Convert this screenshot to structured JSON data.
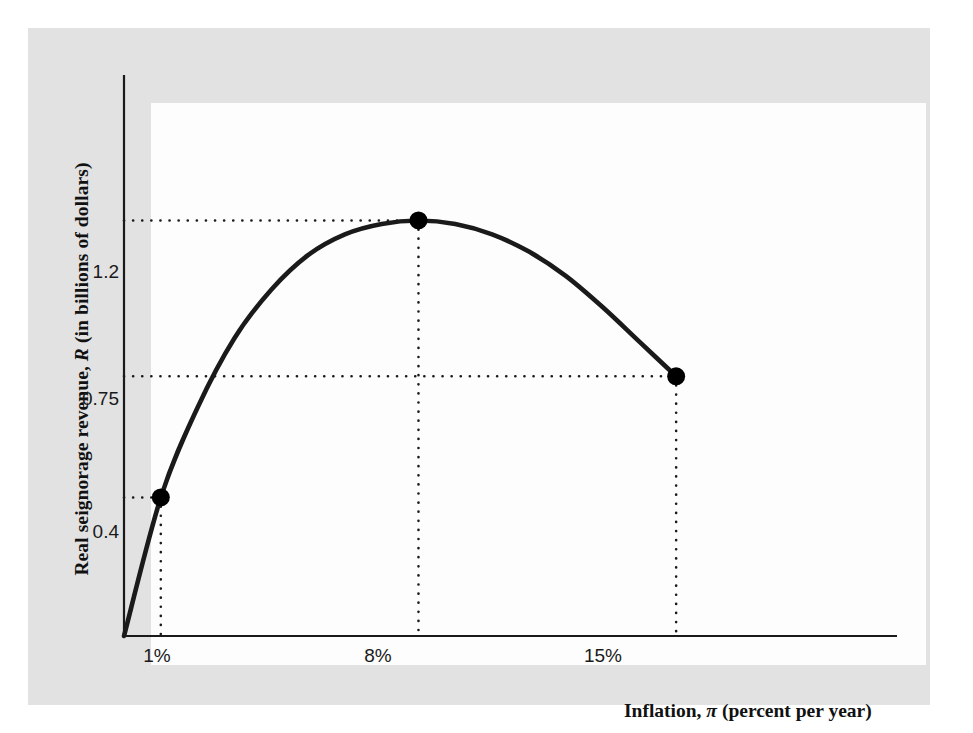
{
  "figure": {
    "background_color": "#e2e2e2",
    "plot_background_color": "#fdfdfd",
    "page_background_color": "#ffffff",
    "curve_color": "#1a1a1a",
    "axis_color": "#1a1a1a",
    "marker_color": "#000000",
    "guide_color": "#1a1a1a"
  },
  "chart_data": {
    "type": "line",
    "title": "",
    "subtitle": "",
    "xlabel_plain": "Inflation, π (percent per year)",
    "xlabel_prefix": "Inflation, ",
    "xlabel_symbol": "π",
    "xlabel_suffix": " (percent per year)",
    "ylabel_plain": "Real seignorage revenue, R (in billions of dollars)",
    "ylabel_prefix": "Real seignorage revenue, ",
    "ylabel_symbol": "R",
    "ylabel_suffix": " (in billions of dollars)",
    "xlim": [
      0,
      21
    ],
    "ylim": [
      0,
      1.62
    ],
    "grid": false,
    "legend": null,
    "x_tick_labels": [
      "1%",
      "8%",
      "15%"
    ],
    "x_tick_values": [
      1,
      8,
      15
    ],
    "y_tick_labels": [
      "0.4",
      "0.75",
      "1.2"
    ],
    "y_tick_values": [
      0.4,
      0.75,
      1.2
    ],
    "series": [
      {
        "name": "Seignorage revenue curve",
        "x": [
          0,
          1,
          2,
          3,
          4,
          5,
          6,
          7,
          8,
          9,
          10,
          11,
          12,
          13,
          14,
          15
        ],
        "y": [
          0.0,
          0.4,
          0.66,
          0.86,
          1.0,
          1.1,
          1.16,
          1.19,
          1.2,
          1.19,
          1.16,
          1.11,
          1.04,
          0.95,
          0.85,
          0.75
        ]
      }
    ],
    "markers": [
      {
        "label": "low-inflation-point",
        "x": 1,
        "y": 0.4,
        "x_label": "1%",
        "y_label": "0.4"
      },
      {
        "label": "revenue-maximizing-point",
        "x": 8,
        "y": 1.2,
        "x_label": "8%",
        "y_label": "1.2"
      },
      {
        "label": "high-inflation-point",
        "x": 15,
        "y": 0.75,
        "x_label": "15%",
        "y_label": "0.75"
      }
    ],
    "guide_lines": [
      {
        "from_axis": "y",
        "value": 0.4,
        "to_x": 1
      },
      {
        "from_axis": "y",
        "value": 0.75,
        "to_x": 15
      },
      {
        "from_axis": "y",
        "value": 1.2,
        "to_x": 8
      },
      {
        "from_axis": "x",
        "value": 1,
        "to_y": 0.4
      },
      {
        "from_axis": "x",
        "value": 8,
        "to_y": 1.2
      },
      {
        "from_axis": "x",
        "value": 15,
        "to_y": 0.75
      }
    ]
  }
}
